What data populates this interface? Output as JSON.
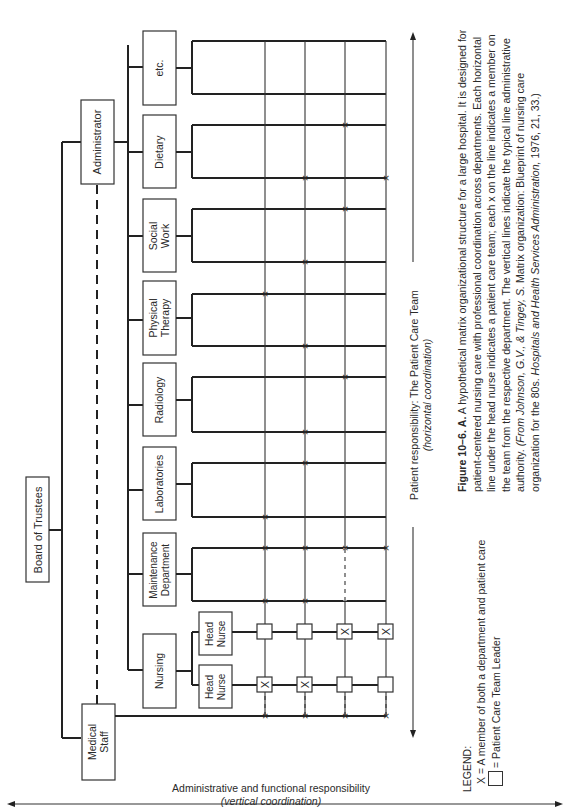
{
  "figure": {
    "top": "Board of Trustees",
    "administrator": "Administrator",
    "medical_staff": [
      "Medical",
      "Staff"
    ],
    "departments": [
      {
        "label": [
          "Nursing"
        ]
      },
      {
        "label": [
          "Maintenance",
          "Department"
        ]
      },
      {
        "label": [
          "Laboratories"
        ]
      },
      {
        "label": [
          "Radiology"
        ]
      },
      {
        "label": [
          "Physical",
          "Therapy"
        ]
      },
      {
        "label": [
          "Social",
          "Work"
        ]
      },
      {
        "label": [
          "Dietary"
        ]
      },
      {
        "label": [
          "etc."
        ]
      }
    ],
    "head_nurses": [
      [
        "Head",
        "Nurse"
      ],
      [
        "Head",
        "Nurse"
      ]
    ],
    "axis_horizontal": {
      "line1": "Patient responsibility: The Patient Care Team",
      "line2": "(horizontal coordination)"
    },
    "axis_vertical": {
      "line1": "Administrative and functional responsibility",
      "line2": "(vertical coordination)"
    }
  },
  "legend": {
    "title": "LEGEND:",
    "x_item": "X = A member of both a department and patient care",
    "square_item": "= Patient Care Team Leader"
  },
  "caption": {
    "label": "Figure 10–6.",
    "part": "A.",
    "text": "A hypothetical matrix organizational structure for a large hospital. It is designed for patient-centered nursing care with professional coordination across departments. Each horizontal line under the head nurse indicates a patient care team; each x on the line indicates a member on the team from the respective department. The vertical lines indicate the typical line administrative authority.",
    "source_italic": "(From Johnson, G.V., & Tingey, S.",
    "source_plain": "Matrix organization: Blueprint of nursing care organization for the 80s.",
    "journal_italic": "Hospitals and Health Services Administration,",
    "tail": "1976, 21, 33.)"
  }
}
